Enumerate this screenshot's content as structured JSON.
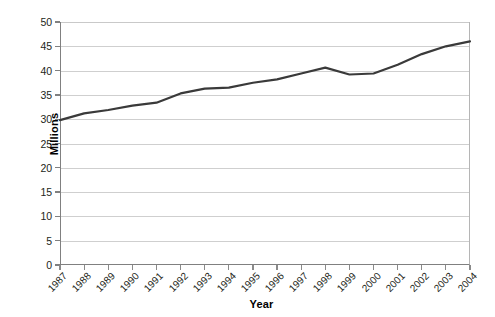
{
  "chart_data": {
    "type": "line",
    "title": "",
    "xlabel": "Year",
    "ylabel": "Millions",
    "categories": [
      "1987",
      "1988",
      "1989",
      "1990",
      "1991",
      "1992",
      "1993",
      "1994",
      "1995",
      "1996",
      "1997",
      "1998",
      "1999",
      "2000",
      "2001",
      "2002",
      "2003",
      "2004"
    ],
    "values": [
      29.8,
      31.2,
      31.9,
      32.8,
      33.4,
      35.3,
      36.3,
      36.5,
      37.5,
      38.2,
      39.4,
      40.6,
      39.2,
      39.4,
      41.2,
      43.4,
      45.0,
      46.0
    ],
    "series": [
      {
        "name": "Millions",
        "values": [
          29.8,
          31.2,
          31.9,
          32.8,
          33.4,
          35.3,
          36.3,
          36.5,
          37.5,
          38.2,
          39.4,
          40.6,
          39.2,
          39.4,
          41.2,
          43.4,
          45.0,
          46.0
        ],
        "color": "#3a3a3a"
      }
    ],
    "ylim": [
      0,
      50
    ],
    "yticks": [
      0,
      5,
      10,
      15,
      20,
      25,
      30,
      35,
      40,
      45,
      50
    ],
    "ytick_labels": [
      "0",
      "5",
      "10",
      "15",
      "20",
      "25",
      "30",
      "35",
      "40",
      "45",
      "50"
    ],
    "xtick_labels": [
      "1987",
      "1988",
      "1989",
      "1990",
      "1991",
      "1992",
      "1993",
      "1994",
      "1995",
      "1996",
      "1997",
      "1998",
      "1999",
      "2000",
      "2001",
      "2002",
      "2003",
      "2004"
    ],
    "xtick_label_rotation_deg": -45,
    "grid": "horizontal",
    "gridline_color": "#cfcfcf",
    "axis_color": "#808080",
    "legend": "none",
    "legend_position": "none",
    "background_color": "#ffffff",
    "annotations": []
  }
}
